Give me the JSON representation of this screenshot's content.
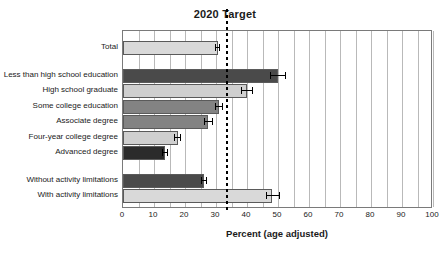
{
  "chart_data": {
    "type": "bar",
    "orientation": "horizontal",
    "title": "2020 Target",
    "xlabel": "Percent (age adjusted)",
    "ylabel": "",
    "xlim": [
      0,
      100
    ],
    "xticks": [
      0,
      10,
      20,
      30,
      40,
      50,
      60,
      70,
      80,
      90,
      100
    ],
    "xtick_labels": [
      "0",
      "10",
      "20",
      "30",
      "40",
      "50",
      "60",
      "70",
      "80",
      "90",
      "100"
    ],
    "grid": "vertical-minor-every-5",
    "minor_tick_step": 5,
    "legend": "none",
    "target_line": {
      "label": "2020 Target",
      "value": 33.2,
      "style": "dotted",
      "color": "#000000"
    },
    "categories": [
      "Total",
      "Less than high school education",
      "High school graduate",
      "Some college education",
      "Associate degree",
      "Four-year college degree",
      "Advanced degree",
      "Without activity limitations",
      "With activity limitations"
    ],
    "values": [
      30.5,
      50.0,
      40.0,
      31.0,
      27.5,
      17.7,
      13.5,
      26.0,
      48.0
    ],
    "errors_low": [
      29.6,
      47.5,
      38.0,
      29.6,
      26.0,
      16.6,
      12.6,
      25.0,
      46.0
    ],
    "errors_high": [
      31.4,
      52.5,
      42.0,
      32.4,
      29.0,
      18.8,
      14.6,
      27.2,
      50.5
    ],
    "bar_colors": [
      "#d9d9d9",
      "#4a4a4a",
      "#cfcfcf",
      "#838383",
      "#838383",
      "#cfcfcf",
      "#2b2b2b",
      "#4a4a4a",
      "#d9d9d9"
    ],
    "group_gaps_after": [
      0,
      6
    ],
    "bar_edge_color": "#5a5a5a",
    "axis_color": "#7a7a7a",
    "gridline_color": "#b9b9b9"
  }
}
